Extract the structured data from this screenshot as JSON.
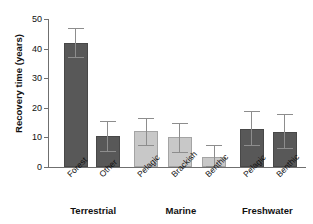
{
  "figure": {
    "top_caption_fragment": "",
    "background": "#ffffff"
  },
  "axes": {
    "ylabel": "Recovery time (years)",
    "yticks": [
      "0",
      "10",
      "20",
      "30",
      "40",
      "50"
    ],
    "ymin": 0,
    "ymax": 50
  },
  "colors": {
    "dark_bar": "#585858",
    "light_bar": "#c8c8c8",
    "axis": "#6f6f6f",
    "error_bar": "#8d8d8d",
    "text": "#111111"
  },
  "groups": [
    {
      "label": "Terrestrial",
      "center_pct": 17.5
    },
    {
      "label": "Marine",
      "center_pct": 51.5
    },
    {
      "label": "Freshwater",
      "center_pct": 85.0
    }
  ],
  "chart_data": {
    "type": "bar",
    "title": "",
    "xlabel": "",
    "ylabel": "Recovery time (years)",
    "ylim": [
      0,
      50
    ],
    "yticks": [
      0,
      10,
      20,
      30,
      40,
      50
    ],
    "grid": false,
    "legend": "none",
    "group_labels": [
      "Terrestrial",
      "Marine",
      "Freshwater"
    ],
    "categories": [
      "Forest",
      "Other",
      "Pelagic",
      "Brackish",
      "Benthic",
      "Pelagic",
      "Benthic"
    ],
    "group_of_category": [
      "Terrestrial",
      "Terrestrial",
      "Marine",
      "Marine",
      "Marine",
      "Freshwater",
      "Freshwater"
    ],
    "values": [
      42.0,
      10.5,
      12.0,
      10.0,
      3.5,
      13.0,
      11.8
    ],
    "error_high": [
      47.0,
      15.5,
      16.5,
      15.0,
      7.5,
      19.0,
      18.0
    ],
    "error_low": [
      37.0,
      5.5,
      7.5,
      5.0,
      0.5,
      7.5,
      6.5
    ],
    "bar_colors": [
      "#585858",
      "#585858",
      "#c8c8c8",
      "#c8c8c8",
      "#c8c8c8",
      "#585858",
      "#585858"
    ]
  },
  "bars": [
    {
      "label": "Forest",
      "value": 42.0,
      "hi": 47.0,
      "lo": 37.0,
      "color": "#585858",
      "left_pct": 6.2,
      "width_pct": 9.3
    },
    {
      "label": "Other",
      "value": 10.5,
      "hi": 15.5,
      "lo": 5.5,
      "color": "#585858",
      "left_pct": 18.6,
      "width_pct": 9.3
    },
    {
      "label": "Pelagic",
      "value": 12.0,
      "hi": 16.5,
      "lo": 7.5,
      "color": "#c8c8c8",
      "left_pct": 33.4,
      "width_pct": 9.3
    },
    {
      "label": "Brackish",
      "value": 10.0,
      "hi": 15.0,
      "lo": 5.0,
      "color": "#c8c8c8",
      "left_pct": 46.5,
      "width_pct": 9.3
    },
    {
      "label": "Benthic",
      "value": 3.5,
      "hi": 7.5,
      "lo": 0.5,
      "color": "#c8c8c8",
      "left_pct": 59.7,
      "width_pct": 9.3
    },
    {
      "label": "Pelagic",
      "value": 13.0,
      "hi": 19.0,
      "lo": 7.5,
      "color": "#585858",
      "left_pct": 74.4,
      "width_pct": 9.3
    },
    {
      "label": "Benthic",
      "value": 11.8,
      "hi": 18.0,
      "lo": 6.5,
      "color": "#585858",
      "left_pct": 87.2,
      "width_pct": 9.3
    }
  ]
}
